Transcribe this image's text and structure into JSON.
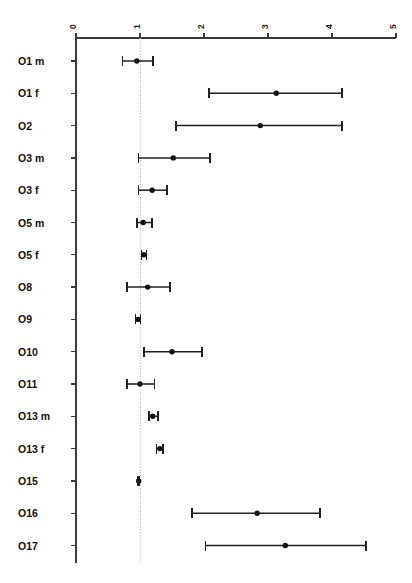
{
  "chart_data": {
    "type": "scatter",
    "subtype": "forest-plot",
    "title": "",
    "subtitle": "",
    "xlabel": "",
    "ylabel": "",
    "xlim": [
      0,
      5
    ],
    "ylim_categories_top_to_bottom": true,
    "grid": false,
    "legend": null,
    "reference_line": {
      "value": 1,
      "style": "dotted",
      "color": "#bdbdbd"
    },
    "axis": {
      "position": "top",
      "tick_values": [
        0,
        1,
        2,
        3,
        4,
        5
      ],
      "tick_labels": [
        "0",
        "1",
        "2",
        "3",
        "4",
        "5"
      ],
      "tick_label_rotation_degrees": 90
    },
    "categories": [
      "O1 m",
      "O1 f",
      "O2",
      "O3 m",
      "O3 f",
      "O5 m",
      "O5 f",
      "O8",
      "O9",
      "O10",
      "O11",
      "O13 m",
      "O13 f",
      "O15",
      "O16",
      "O17"
    ],
    "series": [
      {
        "name": "Estimate with 95% CI",
        "marker": "filled-circle",
        "color": "#111111",
        "values": [
          0.95,
          3.13,
          2.88,
          1.52,
          1.19,
          1.05,
          1.06,
          1.12,
          0.97,
          1.5,
          1.0,
          1.2,
          1.31,
          0.98,
          2.83,
          3.27
        ],
        "ci_lower": [
          0.73,
          2.08,
          1.56,
          0.98,
          0.98,
          0.95,
          1.02,
          0.8,
          0.93,
          1.06,
          0.8,
          1.14,
          1.26,
          0.97,
          1.81,
          2.02
        ],
        "ci_upper": [
          1.2,
          4.16,
          4.16,
          2.09,
          1.42,
          1.19,
          1.1,
          1.47,
          1.01,
          1.97,
          1.23,
          1.28,
          1.36,
          0.99,
          3.81,
          4.53
        ]
      }
    ],
    "points": [
      {
        "label": "O1 m",
        "estimate": 0.95,
        "ci_lower": 0.73,
        "ci_upper": 1.2
      },
      {
        "label": "O1 f",
        "estimate": 3.13,
        "ci_lower": 2.08,
        "ci_upper": 4.16
      },
      {
        "label": "O2",
        "estimate": 2.88,
        "ci_lower": 1.56,
        "ci_upper": 4.16
      },
      {
        "label": "O3 m",
        "estimate": 1.52,
        "ci_lower": 0.98,
        "ci_upper": 2.09
      },
      {
        "label": "O3 f",
        "estimate": 1.19,
        "ci_lower": 0.98,
        "ci_upper": 1.42
      },
      {
        "label": "O5 m",
        "estimate": 1.05,
        "ci_lower": 0.95,
        "ci_upper": 1.19
      },
      {
        "label": "O5 f",
        "estimate": 1.06,
        "ci_lower": 1.02,
        "ci_upper": 1.1
      },
      {
        "label": "O8",
        "estimate": 1.12,
        "ci_lower": 0.8,
        "ci_upper": 1.47
      },
      {
        "label": "O9",
        "estimate": 0.97,
        "ci_lower": 0.93,
        "ci_upper": 1.01
      },
      {
        "label": "O10",
        "estimate": 1.5,
        "ci_lower": 1.06,
        "ci_upper": 1.97
      },
      {
        "label": "O11",
        "estimate": 1.0,
        "ci_lower": 0.8,
        "ci_upper": 1.23
      },
      {
        "label": "O13 m",
        "estimate": 1.2,
        "ci_lower": 1.14,
        "ci_upper": 1.28
      },
      {
        "label": "O13 f",
        "estimate": 1.31,
        "ci_lower": 1.26,
        "ci_upper": 1.36
      },
      {
        "label": "O15",
        "estimate": 0.98,
        "ci_lower": 0.97,
        "ci_upper": 0.99
      },
      {
        "label": "O16",
        "estimate": 2.83,
        "ci_lower": 1.81,
        "ci_upper": 3.81
      },
      {
        "label": "O17",
        "estimate": 3.27,
        "ci_lower": 2.02,
        "ci_upper": 4.53
      }
    ]
  }
}
